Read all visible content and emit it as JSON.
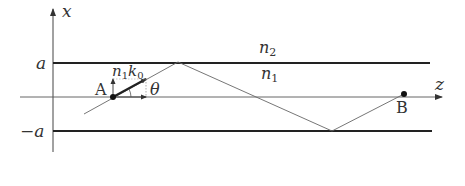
{
  "diagram": {
    "type": "slab-waveguide-ray-diagram",
    "axes": {
      "vertical_label": "x",
      "horizontal_label": "z"
    },
    "boundaries": {
      "upper_label": "a",
      "lower_label": "−a"
    },
    "regions": {
      "cladding_label": "n",
      "cladding_sub": "2",
      "core_label": "n",
      "core_sub": "1"
    },
    "points": {
      "start_label": "A",
      "end_label": "B"
    },
    "wavevector": {
      "label_n": "n",
      "label_n_sub": "1",
      "label_k": "k",
      "label_k_sub": "0"
    },
    "angle_label": "θ",
    "colors": {
      "line": "#333333",
      "boundary": "#222222",
      "ray": "#555555"
    }
  }
}
